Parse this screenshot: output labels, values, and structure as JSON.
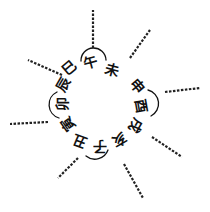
{
  "diagram": {
    "type": "circular-cycle",
    "center": [
      105,
      106
    ],
    "ink_color": "#111111",
    "background": "#ffffff",
    "branches": [
      {
        "char": "巳",
        "x": 69,
        "y": 68
      },
      {
        "char": "午",
        "x": 90,
        "y": 62
      },
      {
        "char": "未",
        "x": 112,
        "y": 70
      },
      {
        "char": "申",
        "x": 137,
        "y": 86
      },
      {
        "char": "酉",
        "x": 141,
        "y": 106
      },
      {
        "char": "戌",
        "x": 136,
        "y": 126
      },
      {
        "char": "亥",
        "x": 119,
        "y": 140
      },
      {
        "char": "子",
        "x": 100,
        "y": 147
      },
      {
        "char": "丑",
        "x": 80,
        "y": 141
      },
      {
        "char": "寅",
        "x": 68,
        "y": 124
      },
      {
        "char": "卯",
        "x": 62,
        "y": 104
      },
      {
        "char": "辰",
        "x": 63,
        "y": 84
      }
    ],
    "cardinal_arcs": [
      "午",
      "酉",
      "子",
      "卯"
    ],
    "annotations_legible": false
  }
}
